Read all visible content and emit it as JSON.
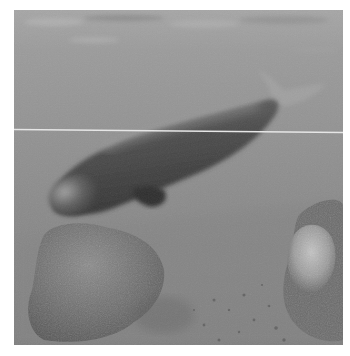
{
  "image": {
    "description": "Grayscale underwater photograph of a dugong swimming above a sandy seabed with coral rocks",
    "subject": "dugong",
    "scene_elements": [
      "water surface",
      "dugong",
      "left coral rock",
      "right coral rock",
      "sandy seabed",
      "horizontal white scan line artifact"
    ],
    "palette": {
      "surface": "#a9a9a9",
      "water": "#8f8f8f",
      "water_deep": "#7c7c7c",
      "dugong_body": "#4a4a4a",
      "dugong_highlight": "#9a9a9a",
      "rock": "#6e6e6e",
      "rock_light": "#b8b8b8",
      "seabed": "#858585",
      "line": "#e6e6e6"
    }
  }
}
